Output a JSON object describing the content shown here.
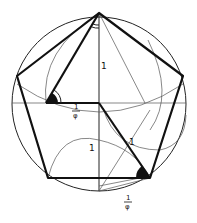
{
  "diagram": {
    "labels": {
      "vertical_side": "1",
      "half_base_num": "1",
      "half_base_den": "φ",
      "lower_arc": "1",
      "diagonal_segment": "1",
      "bottom_frac_num": "1",
      "bottom_frac_den": "φ"
    },
    "colors": {
      "stroke": "#111111",
      "thin_stroke": "#555555",
      "background": "#ffffff"
    }
  }
}
